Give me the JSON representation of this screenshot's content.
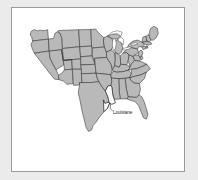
{
  "figure": {
    "kind": "map",
    "region": "contiguous-united-states",
    "projection_note": "USA albers-style outline",
    "background_color": "#ebebeb",
    "frame_background_color": "#ffffff",
    "frame_border_color": "#9a9a9a",
    "state_fill_color": "#b9b9b9",
    "state_border_color": "#2e2e2e",
    "highlight_fill_color": "#ffffff",
    "lake_fill_color": "#ffffff",
    "label_color": "#1a1a1a"
  },
  "labels": [
    {
      "id": "louisiane",
      "text": "Louisiane",
      "x": 122,
      "y": 139,
      "anchor": "middle",
      "has_leader_line": true
    }
  ],
  "highlighted": {
    "name": "Louisiane",
    "fill": "#ffffff"
  }
}
